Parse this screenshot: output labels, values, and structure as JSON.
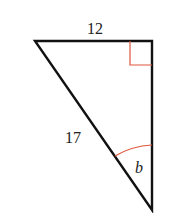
{
  "diagram": {
    "type": "right-triangle",
    "labels": {
      "top_side": "12",
      "hypotenuse": "17",
      "angle": "b"
    },
    "colors": {
      "stroke": "#111111",
      "accent": "#e0553c",
      "text": "#222222"
    }
  }
}
